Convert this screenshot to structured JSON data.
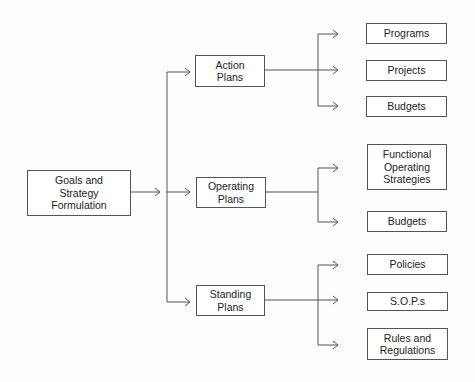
{
  "diagram": {
    "root": {
      "label": "Goals and\nStrategy\nFormulation"
    },
    "plans": [
      {
        "label": "Action\nPlans",
        "children": [
          "Programs",
          "Projects",
          "Budgets"
        ]
      },
      {
        "label": "Operating\nPlans",
        "children": [
          "Functional\nOperating\nStrategies",
          "Budgets"
        ]
      },
      {
        "label": "Standing\nPlans",
        "children": [
          "Policies",
          "S.O.P.s",
          "Rules and\nRegulations"
        ]
      }
    ]
  }
}
